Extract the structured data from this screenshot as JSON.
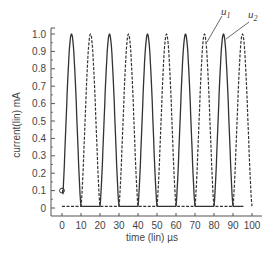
{
  "chart_data": {
    "type": "line",
    "title": "",
    "xlabel": "time (lin) µs",
    "ylabel": "current(lin) mA",
    "xlim": [
      -5,
      102
    ],
    "ylim": [
      -0.05,
      1.05
    ],
    "x_ticks": [
      0,
      10,
      20,
      30,
      40,
      50,
      60,
      70,
      80,
      90,
      100
    ],
    "y_ticks": [
      0,
      0.1,
      0.2,
      0.3,
      0.4,
      0.5,
      0.6,
      0.7,
      0.8,
      0.9,
      1.0
    ],
    "y_tick_labels": [
      "0",
      "0.1",
      "0.2",
      "0.3",
      "0.4",
      "0.5",
      "0.6",
      "0.7",
      "0.8",
      "0.9",
      "1.0"
    ],
    "grid": false,
    "legend": "inline annotations",
    "annotations": [
      {
        "text": "u",
        "subscript": "1",
        "points_to": [
          75,
          0.9
        ],
        "style": "dashed"
      },
      {
        "text": "u",
        "subscript": "2",
        "points_to": [
          85,
          0.95
        ],
        "style": "solid"
      }
    ],
    "marker": {
      "x": 0,
      "y": 0.1,
      "shape": "circle"
    },
    "period_us": 20,
    "series": [
      {
        "name": "u2",
        "style": "solid",
        "peaks_at": [
          5,
          25,
          45,
          65,
          85
        ],
        "x": [
          0,
          2.5,
          5,
          7.5,
          10,
          12.5,
          15,
          17.5,
          20,
          22.5,
          25,
          27.5,
          30,
          32.5,
          35,
          37.5,
          40,
          42.5,
          45,
          47.5,
          50,
          52.5,
          55,
          57.5,
          60,
          62.5,
          65,
          67.5,
          70,
          72.5,
          75,
          77.5,
          80,
          82.5,
          85,
          87.5,
          90,
          92.5,
          95
        ],
        "values": [
          0.1,
          0.62,
          1.0,
          0.62,
          0.1,
          0.02,
          0.01,
          0.02,
          0.1,
          0.62,
          1.0,
          0.62,
          0.1,
          0.02,
          0.01,
          0.02,
          0.1,
          0.62,
          1.0,
          0.62,
          0.1,
          0.02,
          0.01,
          0.02,
          0.1,
          0.62,
          1.0,
          0.62,
          0.1,
          0.02,
          0.01,
          0.02,
          0.1,
          0.62,
          1.0,
          0.62,
          0.1,
          0.02,
          0.02
        ]
      },
      {
        "name": "u1",
        "style": "dashed",
        "peaks_at": [
          15,
          35,
          55,
          75,
          95
        ],
        "x": [
          0,
          2.5,
          5,
          7.5,
          10,
          12.5,
          15,
          17.5,
          20,
          22.5,
          25,
          27.5,
          30,
          32.5,
          35,
          37.5,
          40,
          42.5,
          45,
          47.5,
          50,
          52.5,
          55,
          57.5,
          60,
          62.5,
          65,
          67.5,
          70,
          72.5,
          75,
          77.5,
          80,
          82.5,
          85,
          87.5,
          90,
          92.5,
          95,
          97.5,
          100
        ],
        "values": [
          0.02,
          0.02,
          0.01,
          0.02,
          0.1,
          0.62,
          1.0,
          0.62,
          0.1,
          0.02,
          0.01,
          0.02,
          0.1,
          0.62,
          1.0,
          0.62,
          0.1,
          0.02,
          0.01,
          0.02,
          0.1,
          0.62,
          1.0,
          0.62,
          0.1,
          0.02,
          0.01,
          0.02,
          0.1,
          0.62,
          1.0,
          0.62,
          0.1,
          0.02,
          0.01,
          0.02,
          0.1,
          0.62,
          1.0,
          0.62,
          0.1
        ]
      }
    ]
  },
  "labels": {
    "xlabel": "time (lin) µs",
    "ylabel": "current(lin) mA",
    "u1_base": "u",
    "u1_sub": "1",
    "u2_base": "u",
    "u2_sub": "2"
  },
  "colors": {
    "axis": "#555555",
    "series": "#333333",
    "text": "#444444"
  }
}
